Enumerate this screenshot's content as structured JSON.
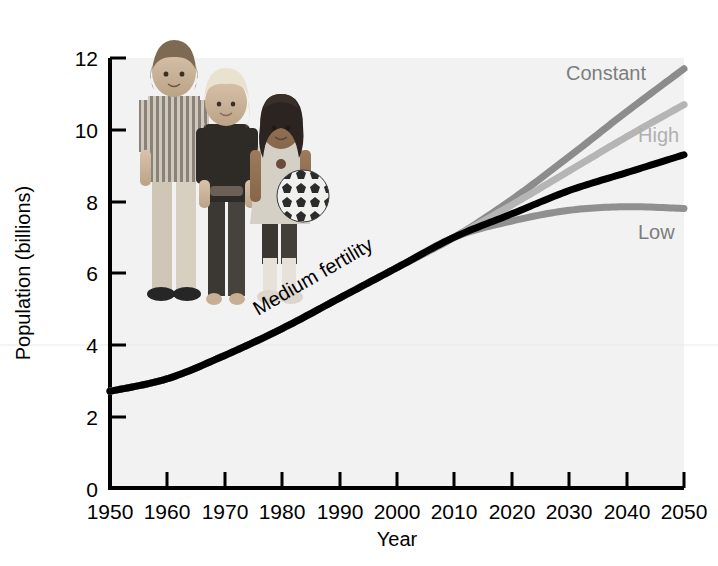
{
  "chart_data": {
    "type": "line",
    "title": "",
    "xlabel": "Year",
    "ylabel": "Population (billions)",
    "xlim": [
      1950,
      2050
    ],
    "ylim": [
      0,
      12
    ],
    "xticks": [
      1950,
      1960,
      1970,
      1980,
      1990,
      2000,
      2010,
      2020,
      2030,
      2040,
      2050
    ],
    "yticks": [
      0,
      2,
      4,
      6,
      8,
      10,
      12
    ],
    "grid": false,
    "legend_position": "inline-right-of-curves",
    "x": [
      1950,
      1960,
      1970,
      1980,
      1990,
      2000,
      2010,
      2020,
      2030,
      2040,
      2050
    ],
    "series": [
      {
        "name": "Constant",
        "color": "#8c8c8c",
        "label_color": "#7d7d7d",
        "values": [
          2.7,
          3.05,
          3.7,
          4.45,
          5.3,
          6.15,
          7.0,
          8.05,
          9.25,
          10.5,
          11.7
        ]
      },
      {
        "name": "High",
        "color": "#b5b5b5",
        "label_color": "#b0b0b0",
        "values": [
          2.7,
          3.05,
          3.7,
          4.45,
          5.3,
          6.15,
          7.0,
          7.9,
          8.85,
          9.8,
          10.7
        ]
      },
      {
        "name": "Medium fertility",
        "color": "#000000",
        "label_color": "#000000",
        "values": [
          2.7,
          3.05,
          3.7,
          4.45,
          5.3,
          6.15,
          7.0,
          7.65,
          8.3,
          8.8,
          9.3
        ]
      },
      {
        "name": "Low",
        "color": "#909090",
        "label_color": "#7d7d7d",
        "values": [
          2.7,
          3.05,
          3.7,
          4.45,
          5.3,
          6.15,
          7.0,
          7.45,
          7.75,
          7.85,
          7.8
        ]
      }
    ],
    "annotations": [
      {
        "text": "Medium fertility",
        "x": 1988,
        "y": 4.9,
        "rotation": -30
      },
      {
        "text": "Constant",
        "x": 2036,
        "y": 11.2
      },
      {
        "text": "High",
        "x": 2043,
        "y": 9.55
      },
      {
        "text": "Low",
        "x": 2043,
        "y": 7.05
      }
    ],
    "inset_image": {
      "name": "photo-three-children",
      "description": "Photograph of three children standing together, one holding a soccer ball"
    }
  },
  "colors": {
    "plot_background": "#f2f2f2",
    "axis": "#000000",
    "constant": "#8c8c8c",
    "high": "#b5b5b5",
    "medium": "#000000",
    "low": "#909090"
  }
}
